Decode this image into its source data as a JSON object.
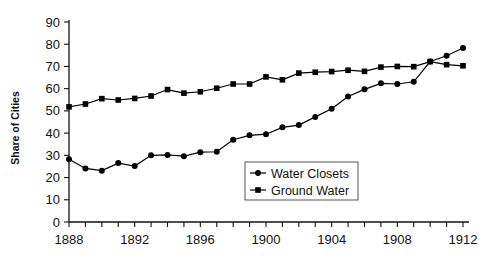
{
  "chart_data": {
    "type": "line",
    "title": "",
    "xlabel": "",
    "ylabel": "Share of Cities",
    "xlim": [
      1888,
      1912
    ],
    "ylim": [
      0,
      90
    ],
    "ytick_step": 10,
    "xtick_step": 1,
    "xtick_label_step": 4,
    "grid": false,
    "legend_position": "center-right-inside",
    "x": [
      1888,
      1889,
      1890,
      1891,
      1892,
      1893,
      1894,
      1895,
      1896,
      1897,
      1898,
      1899,
      1900,
      1901,
      1902,
      1903,
      1904,
      1905,
      1906,
      1907,
      1908,
      1909,
      1910,
      1911,
      1912
    ],
    "xticklabels": [
      "1888",
      "",
      "",
      "",
      "1892",
      "",
      "",
      "",
      "1896",
      "",
      "",
      "",
      "1900",
      "",
      "",
      "",
      "1904",
      "",
      "",
      "",
      "1908",
      "",
      "",
      "",
      "1912"
    ],
    "yticklabels": [
      "0",
      "10",
      "20",
      "30",
      "40",
      "50",
      "60",
      "70",
      "80",
      "90"
    ],
    "yticks": [
      0,
      10,
      20,
      30,
      40,
      50,
      60,
      70,
      80,
      90
    ],
    "series": [
      {
        "name": "Water Closets",
        "marker": "circle",
        "color": "#000000",
        "values": [
          28.2,
          24.1,
          23.1,
          26.5,
          25.2,
          30.0,
          30.2,
          29.6,
          31.4,
          31.6,
          37.0,
          39.0,
          39.5,
          42.6,
          43.6,
          47.3,
          51.0,
          56.5,
          59.7,
          62.4,
          62.1,
          63.1,
          72.2,
          74.8,
          78.3
        ]
      },
      {
        "name": "Ground Water",
        "marker": "square",
        "color": "#000000",
        "values": [
          51.8,
          53.1,
          55.5,
          54.9,
          55.6,
          56.7,
          59.6,
          58.0,
          58.6,
          60.2,
          62.1,
          62.1,
          65.3,
          64.0,
          67.0,
          67.4,
          67.7,
          68.3,
          67.8,
          69.7,
          70.0,
          69.9,
          72.2,
          70.8,
          70.3
        ]
      }
    ]
  },
  "legend": {
    "items": [
      {
        "label": "Water Closets",
        "marker": "circle"
      },
      {
        "label": "Ground Water",
        "marker": "square"
      }
    ]
  }
}
